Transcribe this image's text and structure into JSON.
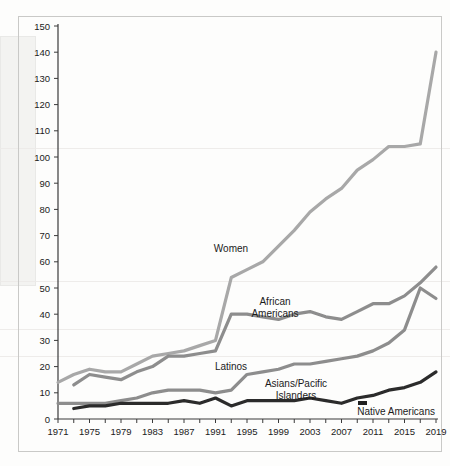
{
  "chart_data": {
    "type": "line",
    "title": "",
    "subtitle": "",
    "xlabel": "",
    "ylabel": "",
    "xlim": [
      1971,
      2019
    ],
    "ylim": [
      0,
      150
    ],
    "y_ticks": [
      0,
      10,
      20,
      30,
      40,
      50,
      60,
      70,
      80,
      90,
      100,
      110,
      120,
      130,
      140,
      150
    ],
    "x_ticks": [
      1971,
      1973,
      1975,
      1977,
      1979,
      1981,
      1983,
      1985,
      1987,
      1989,
      1991,
      1993,
      1995,
      1997,
      1999,
      2001,
      2003,
      2005,
      2007,
      2009,
      2011,
      2013,
      2015,
      2017,
      2019
    ],
    "x_tick_labels": [
      "1971",
      "1975",
      "1979",
      "1983",
      "1987",
      "1991",
      "1995",
      "1999",
      "2003",
      "2007",
      "2011",
      "2015",
      "2019"
    ],
    "grid": false,
    "legend_position": "inline-annotations",
    "series": [
      {
        "name": "Women",
        "color": "#a8a8a8",
        "x": [
          1971,
          1973,
          1975,
          1977,
          1979,
          1981,
          1983,
          1985,
          1987,
          1989,
          1991,
          1993,
          1995,
          1997,
          1999,
          2001,
          2003,
          2005,
          2007,
          2009,
          2011,
          2013,
          2015,
          2017,
          2019
        ],
        "values": [
          14,
          17,
          19,
          18,
          18,
          21,
          24,
          25,
          26,
          28,
          30,
          54,
          57,
          60,
          66,
          72,
          79,
          84,
          88,
          95,
          99,
          104,
          104,
          105,
          140
        ]
      },
      {
        "name": "African Americans",
        "color": "#8d8d8d",
        "x": [
          1973,
          1975,
          1977,
          1979,
          1981,
          1983,
          1985,
          1987,
          1989,
          1991,
          1993,
          1995,
          1997,
          1999,
          2001,
          2003,
          2005,
          2007,
          2009,
          2011,
          2013,
          2015,
          2017,
          2019
        ],
        "values": [
          13,
          17,
          16,
          15,
          18,
          20,
          24,
          24,
          25,
          26,
          40,
          40,
          39,
          38,
          40,
          41,
          39,
          38,
          41,
          44,
          44,
          47,
          52,
          58
        ]
      },
      {
        "name": "Latinos",
        "color": "#8d8d8d",
        "x": [
          1971,
          1973,
          1975,
          1977,
          1979,
          1981,
          1983,
          1985,
          1987,
          1989,
          1991,
          1993,
          1995,
          1997,
          1999,
          2001,
          2003,
          2005,
          2007,
          2009,
          2011,
          2013,
          2015,
          2017,
          2019
        ],
        "values": [
          6,
          6,
          6,
          6,
          7,
          8,
          10,
          11,
          11,
          11,
          10,
          11,
          17,
          18,
          19,
          21,
          21,
          22,
          23,
          24,
          26,
          29,
          34,
          50,
          46
        ]
      },
      {
        "name": "Asians/Pacific Islanders",
        "color": "#2b2b2b",
        "x": [
          1973,
          1975,
          1977,
          1979,
          1981,
          1983,
          1985,
          1987,
          1989,
          1991,
          1993,
          1995,
          1997,
          1999,
          2001,
          2003,
          2005,
          2007,
          2009,
          2011,
          2013,
          2015,
          2017,
          2019
        ],
        "values": [
          4,
          5,
          5,
          6,
          6,
          6,
          6,
          7,
          6,
          8,
          5,
          7,
          7,
          7,
          7,
          8,
          7,
          6,
          8,
          9,
          11,
          12,
          14,
          18
        ]
      },
      {
        "name": "Native Americans",
        "color": "#1f1f1f",
        "x": [],
        "values": []
      }
    ],
    "annotations": [
      {
        "label": "Women",
        "x": 1996,
        "y": 72
      },
      {
        "label": "African Americans",
        "x": 2000,
        "y": 47
      },
      {
        "label": "Latinos",
        "x": 1995,
        "y": 22
      },
      {
        "label": "Asians/Pacific Islanders",
        "x": 2001,
        "y": 15
      },
      {
        "label": "Native Americans",
        "x": 2013,
        "y": 4
      }
    ]
  },
  "labels": {
    "women": "Women",
    "african_americans_line1": "African",
    "african_americans_line2": "Americans",
    "latinos": "Latinos",
    "asians_line1": "Asians/Pacific",
    "asians_line2": "Islanders",
    "native_americans": "Native Americans"
  },
  "axis": {
    "y_labels": [
      "150",
      "140",
      "130",
      "120",
      "110",
      "100",
      "90",
      "80",
      "70",
      "60",
      "50",
      "40",
      "30",
      "20",
      "10",
      "0"
    ],
    "x_labels": [
      "1971",
      "1975",
      "1979",
      "1983",
      "1987",
      "1991",
      "1995",
      "1999",
      "2003",
      "2007",
      "2011",
      "2015",
      "2019"
    ]
  }
}
